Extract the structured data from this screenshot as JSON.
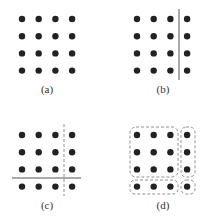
{
  "panels": [
    {
      "id": "a",
      "label": "(a)",
      "origin": [
        22,
        19
      ],
      "divider": "none"
    },
    {
      "id": "b",
      "label": "(b)",
      "origin": [
        137,
        19
      ],
      "divider": "solid-vertical"
    },
    {
      "id": "c",
      "label": "(c)",
      "origin": [
        22,
        135
      ],
      "divider": "dashed-vertical-solid-horizontal"
    },
    {
      "id": "d",
      "label": "(d)",
      "origin": [
        137,
        135
      ],
      "divider": "dashed-groups"
    }
  ],
  "grid": {
    "rows": 4,
    "cols": 4,
    "spacing_x": 16.7,
    "spacing_y": 17.2,
    "dot_radius": 3.2
  },
  "colors": {
    "dot": "#222222",
    "line": "#555555",
    "dashed": "#777777",
    "label": "#333333"
  }
}
